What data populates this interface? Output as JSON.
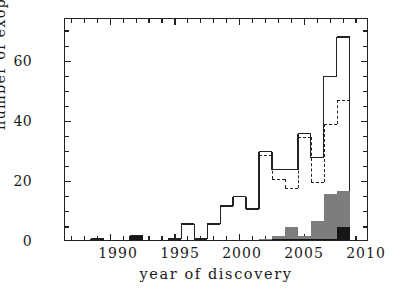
{
  "figure": {
    "xtitle": "year of discovery",
    "ytitle": "number of exoplanets"
  },
  "axes": {
    "x_ticklabels": [
      "1990",
      "1995",
      "2000",
      "2005",
      "2010"
    ],
    "y_ticklabels": [
      "0",
      "20",
      "40",
      "60"
    ]
  },
  "chart_data": {
    "type": "bar",
    "title": "",
    "xlabel": "year of discovery",
    "ylabel": "number of exoplanets",
    "xlim": [
      1986.5,
      2010.0
    ],
    "ylim": [
      0,
      74
    ],
    "xticks": [
      1990,
      1995,
      2000,
      2005,
      2010
    ],
    "yticks": [
      0,
      20,
      40,
      60
    ],
    "x_minor_tick_step": 1,
    "y_minor_tick_step": 5,
    "grid": false,
    "legend": null,
    "bin_width": 1,
    "series": [
      {
        "name": "all exoplanets (solid step histogram)",
        "style": "solid-step-outline",
        "color": "#222222",
        "x": [
          1989,
          1990,
          1991,
          1992,
          1993,
          1994,
          1995,
          1996,
          1997,
          1998,
          1999,
          2000,
          2001,
          2002,
          2003,
          2004,
          2005,
          2006,
          2007,
          2008
        ],
        "values": [
          1,
          0,
          0,
          2,
          0,
          0,
          1,
          6,
          1,
          6,
          12,
          15,
          11,
          30,
          24,
          24,
          36,
          28,
          55,
          68
        ]
      },
      {
        "name": "subset (dashed step histogram)",
        "style": "dashed-step-outline",
        "color": "#222222",
        "x": [
          2002,
          2003,
          2004,
          2005,
          2006,
          2007,
          2008
        ],
        "values": [
          29,
          21,
          18,
          35,
          20,
          39,
          47
        ]
      },
      {
        "name": "grey filled bars",
        "style": "filled-bar",
        "color": "#7d7d7d",
        "x": [
          2002,
          2003,
          2004,
          2005,
          2006,
          2007,
          2008
        ],
        "values": [
          1,
          2,
          5,
          2,
          7,
          16,
          17
        ]
      },
      {
        "name": "black filled bars",
        "style": "filled-bar",
        "color": "#161616",
        "x": [
          1992,
          2002,
          2003,
          2004,
          2005,
          2006,
          2007,
          2008
        ],
        "values": [
          2,
          0,
          1,
          1,
          1,
          1,
          1,
          5
        ]
      }
    ]
  }
}
